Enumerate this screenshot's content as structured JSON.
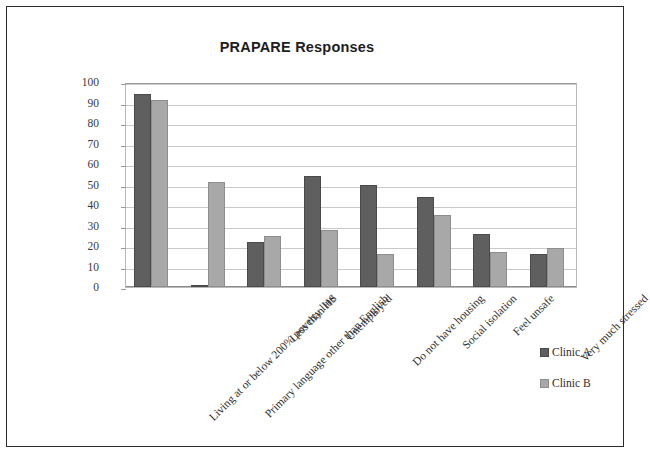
{
  "chart_data": {
    "type": "bar",
    "title": "PRAPARE Responses",
    "xlabel": "",
    "ylabel": "",
    "ylim": [
      0,
      100
    ],
    "ytick_step": 10,
    "yticks": [
      100,
      90,
      80,
      70,
      60,
      50,
      40,
      30,
      20,
      10,
      0
    ],
    "grid": true,
    "legend_position": "right",
    "categories": [
      "Living at or below 200% poverty line",
      "Primary language other than English",
      "Less than HS",
      "Unemployed",
      "Do not have housing",
      "Social isolation",
      "Feel unsafe",
      "Very much stressed"
    ],
    "series": [
      {
        "name": "Clinic A",
        "color": "#5f5f5f",
        "values": [
          94,
          1,
          22,
          54,
          50,
          44,
          26,
          16
        ]
      },
      {
        "name": "Clinic B",
        "color": "#a8a8a8",
        "values": [
          91,
          51,
          25,
          28,
          16,
          35,
          17,
          19
        ]
      }
    ]
  },
  "legend": {
    "items": [
      {
        "label": "Clinic A",
        "swatch": "swatch-a"
      },
      {
        "label": "Clinic B",
        "swatch": "swatch-b"
      }
    ]
  }
}
